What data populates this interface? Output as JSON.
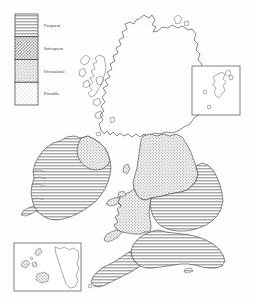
{
  "figure": {
    "kind": "distribution-map",
    "region": "British Isles",
    "background_color": "#fefefe",
    "outline_color": "#4a4a4a",
    "width": 253,
    "height": 303
  },
  "legend": {
    "name": "frequency-legend",
    "box": {
      "x": 15,
      "y": 14,
      "width": 23,
      "height": 91
    },
    "border_color": "#3a3a3a",
    "items": [
      {
        "label": "Frequent",
        "pattern": "horizontal-lines",
        "swatch_color": "#b8b8b8",
        "label_x": 44,
        "label_y": 24
      },
      {
        "label": "Infrequent",
        "pattern": "dense-stipple",
        "swatch_color": "#c0c0c0",
        "label_x": 44,
        "label_y": 46
      },
      {
        "label": "Occasional",
        "pattern": "medium-stipple",
        "swatch_color": "#cbcbcb",
        "label_x": 44,
        "label_y": 69
      },
      {
        "label": "Possible",
        "pattern": "sparse-stipple",
        "swatch_color": "#e2e2e2",
        "label_x": 44,
        "label_y": 92
      }
    ]
  },
  "insets": [
    {
      "name": "shetland-inset",
      "box": {
        "x": 192,
        "y": 66,
        "width": 48,
        "height": 49
      },
      "border_color": "#4a4a4a",
      "fill": "none"
    },
    {
      "name": "channel-islands-inset",
      "box": {
        "x": 14,
        "y": 243,
        "width": 67,
        "height": 48
      },
      "border_color": "#4a4a4a",
      "fill": "none"
    }
  ],
  "regions": [
    {
      "name": "scotland",
      "fill": "none"
    },
    {
      "name": "ireland-main",
      "fill": "horizontal-lines"
    },
    {
      "name": "ireland-northeast",
      "fill": "medium-stipple"
    },
    {
      "name": "england-north",
      "fill": "medium-stipple"
    },
    {
      "name": "england-central-east",
      "fill": "horizontal-lines"
    },
    {
      "name": "england-south",
      "fill": "horizontal-lines"
    },
    {
      "name": "wales",
      "fill": "medium-stipple"
    },
    {
      "name": "isle-of-man",
      "fill": "medium-stipple"
    }
  ]
}
